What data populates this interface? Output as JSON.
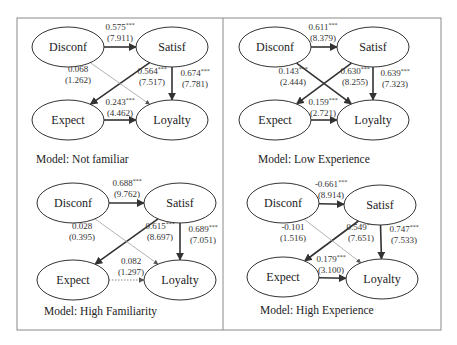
{
  "figure": {
    "frame": {
      "x": 17,
      "y": 18,
      "width": 424,
      "height": 312,
      "divider_x": 223
    },
    "significance_marker": "***",
    "node_names": [
      "Disconf",
      "Satisf",
      "Expect",
      "Loyalty"
    ]
  },
  "panels": [
    {
      "id": "not-familiar",
      "model_label": "Model: Not familiar",
      "label_pos": [
        36,
        163
      ],
      "nodes": {
        "Disconf": {
          "cx": 68,
          "cy": 47
        },
        "Satisf": {
          "cx": 172,
          "cy": 47
        },
        "Expect": {
          "cx": 68,
          "cy": 120
        },
        "Loyalty": {
          "cx": 172,
          "cy": 120
        }
      },
      "paths": [
        {
          "from": "Disconf",
          "to": "Satisf",
          "coef": "0.575",
          "t": "(7.911)",
          "sig": true,
          "style": "strong",
          "lx": 120,
          "ly": 30
        },
        {
          "from": "Satisf",
          "to": "Expect",
          "coef": "0.564",
          "t": "(7.517)",
          "sig": true,
          "style": "strong",
          "lx": 152,
          "ly": 74
        },
        {
          "from": "Disconf",
          "to": "Loyalty",
          "coef": "0.068",
          "t": "(1.262)",
          "sig": false,
          "style": "weak",
          "lx": 78,
          "ly": 72
        },
        {
          "from": "Satisf",
          "to": "Loyalty",
          "coef": "0.674",
          "t": "(7.781)",
          "sig": true,
          "style": "strong",
          "lx": 195,
          "ly": 76
        },
        {
          "from": "Expect",
          "to": "Loyalty",
          "coef": "0.243",
          "t": "(4.462)",
          "sig": true,
          "style": "strong",
          "lx": 120,
          "ly": 105
        }
      ]
    },
    {
      "id": "low-experience",
      "model_label": "Model: Low Experience",
      "label_pos": [
        258,
        163
      ],
      "nodes": {
        "Disconf": {
          "cx": 275,
          "cy": 47
        },
        "Satisf": {
          "cx": 373,
          "cy": 47
        },
        "Expect": {
          "cx": 275,
          "cy": 120
        },
        "Loyalty": {
          "cx": 373,
          "cy": 120
        }
      },
      "paths": [
        {
          "from": "Disconf",
          "to": "Satisf",
          "coef": "0.611",
          "t": "(8.379)",
          "sig": true,
          "style": "strong",
          "lx": 323,
          "ly": 30
        },
        {
          "from": "Satisf",
          "to": "Expect",
          "coef": "0.630",
          "t": "(8.255)",
          "sig": true,
          "style": "strong",
          "lx": 355,
          "ly": 74
        },
        {
          "from": "Disconf",
          "to": "Loyalty",
          "coef": "0.143",
          "t": "(2.444)",
          "sig": true,
          "style": "strong",
          "lx": 293,
          "ly": 74
        },
        {
          "from": "Satisf",
          "to": "Loyalty",
          "coef": "0.639",
          "t": "(7.323)",
          "sig": true,
          "style": "strong",
          "lx": 395,
          "ly": 76
        },
        {
          "from": "Expect",
          "to": "Loyalty",
          "coef": "0.159",
          "t": "(2.721)",
          "sig": true,
          "style": "strong",
          "lx": 323,
          "ly": 105
        }
      ]
    },
    {
      "id": "high-familiarity",
      "model_label": "Model: High Familiarity",
      "label_pos": [
        44,
        315
      ],
      "nodes": {
        "Disconf": {
          "cx": 73,
          "cy": 203
        },
        "Satisf": {
          "cx": 180,
          "cy": 203
        },
        "Expect": {
          "cx": 73,
          "cy": 280
        },
        "Loyalty": {
          "cx": 180,
          "cy": 280
        }
      },
      "paths": [
        {
          "from": "Disconf",
          "to": "Satisf",
          "coef": "0.688",
          "t": "(9.762)",
          "sig": true,
          "style": "strong",
          "lx": 127,
          "ly": 186
        },
        {
          "from": "Satisf",
          "to": "Expect",
          "coef": "0.615",
          "t": "(8.697)",
          "sig": true,
          "style": "strong",
          "lx": 160,
          "ly": 229
        },
        {
          "from": "Disconf",
          "to": "Loyalty",
          "coef": "0.028",
          "t": "(0.395)",
          "sig": false,
          "style": "weak",
          "lx": 82,
          "ly": 229
        },
        {
          "from": "Satisf",
          "to": "Loyalty",
          "coef": "0.689",
          "t": "(7.051)",
          "sig": true,
          "style": "strong",
          "lx": 203,
          "ly": 232
        },
        {
          "from": "Expect",
          "to": "Loyalty",
          "coef": "0.082",
          "t": "(1.297)",
          "sig": false,
          "style": "dotted",
          "lx": 131,
          "ly": 264
        }
      ]
    },
    {
      "id": "high-experience",
      "model_label": "Model: High Experience",
      "label_pos": [
        260,
        314
      ],
      "nodes": {
        "Disconf": {
          "cx": 283,
          "cy": 203
        },
        "Satisf": {
          "cx": 380,
          "cy": 205
        },
        "Expect": {
          "cx": 283,
          "cy": 277
        },
        "Loyalty": {
          "cx": 382,
          "cy": 279
        }
      },
      "paths": [
        {
          "from": "Disconf",
          "to": "Satisf",
          "coef": "-0.661",
          "t": "(8.914)",
          "sig": true,
          "style": "strong",
          "lx": 331,
          "ly": 187
        },
        {
          "from": "Satisf",
          "to": "Expect",
          "coef": "0.549",
          "t": "(7.651)",
          "sig": true,
          "style": "strong",
          "lx": 361,
          "ly": 230
        },
        {
          "from": "Disconf",
          "to": "Loyalty",
          "coef": "-0.101",
          "t": "(1.516)",
          "sig": false,
          "style": "weak",
          "lx": 293,
          "ly": 230
        },
        {
          "from": "Satisf",
          "to": "Loyalty",
          "coef": "0.747",
          "t": "(7.533)",
          "sig": true,
          "style": "strong",
          "lx": 404,
          "ly": 232
        },
        {
          "from": "Expect",
          "to": "Loyalty",
          "coef": "0.179",
          "t": "(3.100)",
          "sig": true,
          "style": "strong",
          "lx": 331,
          "ly": 262
        }
      ]
    }
  ]
}
